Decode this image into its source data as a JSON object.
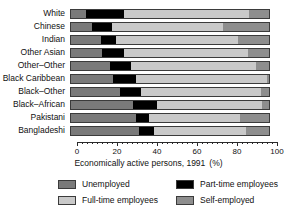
{
  "chart_data": {
    "type": "bar",
    "orientation": "horizontal",
    "stacked": true,
    "title": "",
    "xlabel": "Economically active persons, 1991",
    "xunit": "(%)",
    "ylabel": "",
    "xlim": [
      0,
      100
    ],
    "xticks": [
      0,
      20,
      40,
      60,
      80,
      100
    ],
    "xtick_labels": [
      "0",
      "20",
      "40",
      "60",
      "80",
      "100"
    ],
    "minor_tick_step": 2.5,
    "grid": false,
    "legend_position": "bottom",
    "categories": [
      "White",
      "Chinese",
      "Indian",
      "Other Asian",
      "Other–Other",
      "Black Caribbean",
      "Black–Other",
      "Black–African",
      "Pakistani",
      "Bangladeshi"
    ],
    "series": [
      {
        "name": "Unemployed",
        "color": "#7a7a7a",
        "values": [
          8,
          11,
          15.5,
          16,
          20,
          21.5,
          25,
          31.5,
          33,
          34.5
        ]
      },
      {
        "name": "Part-time employees",
        "color": "#000000",
        "values": [
          19,
          10,
          7.5,
          11,
          10.5,
          11.5,
          10.5,
          12,
          6.5,
          7.5
        ]
      },
      {
        "name": "Full-time employees",
        "color": "#c9c9c9",
        "values": [
          62.5,
          55.5,
          61,
          62,
          62.5,
          65.5,
          60,
          52.5,
          45.5,
          46
        ]
      },
      {
        "name": "Self-employed",
        "color": "#8e8e8e",
        "values": [
          10.5,
          23.5,
          16,
          11,
          7,
          1.5,
          4.5,
          4,
          15,
          12
        ]
      }
    ]
  },
  "legend": {
    "items": [
      {
        "label": "Unemployed",
        "swatch": "sw-unemployed"
      },
      {
        "label": "Part-time employees",
        "swatch": "sw-parttime"
      },
      {
        "label": "Full-time employees",
        "swatch": "sw-fulltime"
      },
      {
        "label": "Self-employed",
        "swatch": "sw-selfemployed"
      }
    ]
  }
}
